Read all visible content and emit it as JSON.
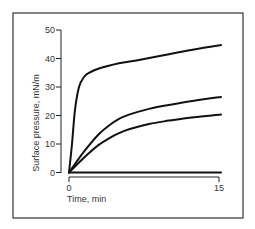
{
  "chart_data": {
    "type": "line",
    "title": "",
    "xlabel": "Time, min",
    "ylabel": "Surface pressure, mN/m",
    "xlim": [
      0,
      15
    ],
    "ylim": [
      0,
      50
    ],
    "x_ticks": [
      0,
      15
    ],
    "x_tick_labels": [
      "0",
      "15"
    ],
    "y_ticks": [
      0,
      10,
      20,
      30,
      40,
      50
    ],
    "y_tick_labels": [
      "0",
      "10",
      "20",
      "30",
      "40",
      "50"
    ],
    "grid": false,
    "legend": null,
    "series": [
      {
        "name": "curve-1",
        "x": [
          0,
          0.3,
          0.6,
          1.0,
          1.5,
          2,
          3,
          5,
          7,
          10,
          12.5,
          15.2
        ],
        "values": [
          0,
          10,
          22,
          30,
          33.5,
          35,
          36.5,
          38.3,
          39.5,
          41.5,
          43.2,
          44.7
        ]
      },
      {
        "name": "curve-2",
        "x": [
          0,
          1,
          2,
          3,
          4,
          5,
          6,
          8,
          10,
          12.5,
          15.2
        ],
        "values": [
          0,
          5,
          9.5,
          13.5,
          16.5,
          18.8,
          20.3,
          22.3,
          23.7,
          25.2,
          26.5
        ]
      },
      {
        "name": "curve-3",
        "x": [
          0,
          1,
          2,
          3,
          4,
          5,
          6,
          8,
          10,
          12.5,
          15.2
        ],
        "values": [
          0,
          3.5,
          6.8,
          9.8,
          12,
          13.8,
          15.2,
          17,
          18.2,
          19.4,
          20.3
        ]
      },
      {
        "name": "curve-4",
        "x": [
          0,
          15.2
        ],
        "values": [
          0,
          0
        ]
      }
    ]
  }
}
